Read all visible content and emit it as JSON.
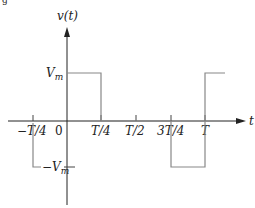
{
  "figure": {
    "caption_fragment": "g",
    "y_axis_label": "v(t)",
    "x_axis_label": "t",
    "level_labels": {
      "positive": {
        "main": "V",
        "sub": "m"
      },
      "negative": {
        "main": "−V",
        "sub": "m"
      }
    },
    "x_ticks": [
      {
        "label": "−T/4",
        "t": -0.25
      },
      {
        "label": "0",
        "t": 0
      },
      {
        "label": "T/4",
        "t": 0.25
      },
      {
        "label": "T/2",
        "t": 0.5
      },
      {
        "label": "3T/4",
        "t": 0.75
      },
      {
        "label": "T",
        "t": 1.0
      }
    ],
    "waveform": {
      "type": "square",
      "segments": [
        {
          "from_t": -0.25,
          "to_t": 0,
          "level": "-Vm"
        },
        {
          "from_t": 0,
          "to_t": 0.25,
          "level": "Vm"
        },
        {
          "from_t": 0.25,
          "to_t": 0.75,
          "level": "0"
        },
        {
          "from_t": 0.75,
          "to_t": 1.0,
          "level": "-Vm"
        },
        {
          "from_t": 1.0,
          "to_t": 1.2,
          "level": "Vm"
        }
      ]
    },
    "colors": {
      "axis": "#222222",
      "waveform": "#888888",
      "text": "#222222"
    }
  }
}
